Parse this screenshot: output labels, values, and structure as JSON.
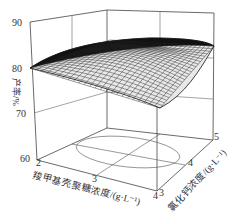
{
  "chart_data": {
    "type": "surface3d",
    "title": "",
    "zlabel": "产率/%",
    "xlabel": "羧甲基壳聚糖浓度/(g·L⁻¹)",
    "ylabel": "氯化钙浓度/(g·L⁻¹)",
    "z_ticks": [
      "60",
      "70",
      "80",
      "90"
    ],
    "x_ticks": [
      "2",
      "3",
      "4"
    ],
    "y_ticks": [
      "3",
      "4",
      "5"
    ],
    "zlim": [
      60,
      90
    ],
    "xlim": [
      2,
      4
    ],
    "ylim": [
      3,
      5
    ],
    "grid": true,
    "surface": {
      "x": [
        2,
        2.5,
        3,
        3.5,
        4
      ],
      "y": [
        3,
        3.5,
        4,
        4.5,
        5
      ],
      "z": [
        [
          80,
          82,
          83,
          83,
          82.5
        ],
        [
          81,
          83.5,
          84.5,
          84.5,
          84
        ],
        [
          80,
          82.5,
          84,
          84.5,
          84
        ],
        [
          77,
          80,
          82,
          83,
          83
        ],
        [
          73,
          76.5,
          79,
          81,
          81.5
        ]
      ]
    },
    "floor_contour": "ellipse",
    "colors": {
      "mesh": "#1a1a1a",
      "axes": "#333333",
      "background": "#ffffff"
    }
  }
}
